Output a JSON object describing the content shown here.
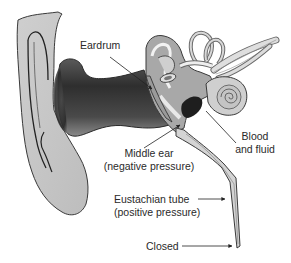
{
  "diagram": {
    "labels": {
      "eardrum": "Eardrum",
      "middle_ear_line1": "Middle ear",
      "middle_ear_line2": "(negative pressure)",
      "blood_line1": "Blood",
      "blood_line2": "and fluid",
      "eustachian_line1": "Eustachian tube",
      "eustachian_line2": "(positive pressure)",
      "closed": "Closed"
    },
    "structures": [
      "outer-ear",
      "ear-canal",
      "eardrum",
      "middle-ear",
      "ossicles",
      "semicircular-canals",
      "cochlea",
      "auditory-nerve",
      "blood-and-fluid",
      "eustachian-tube"
    ],
    "colors": {
      "outline": "#3a3a3a",
      "ear_fill": "#c8c8c8",
      "canal_dark": "#3c3c3c",
      "canal_mid": "#777777",
      "fluid": "#1e1e1e",
      "tube_fill": "#d4d4d4",
      "text": "#2a2a2a"
    }
  }
}
